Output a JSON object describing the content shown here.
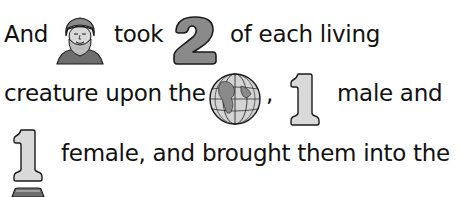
{
  "rebus": {
    "line1": {
      "w1": "And",
      "icon_noah": "noah-portrait",
      "w2": "took",
      "num": "2",
      "w3": "of each living"
    },
    "line2": {
      "w1": "creature upon the",
      "icon_globe": "globe",
      "comma": ",",
      "num": "1",
      "w2": "male and"
    },
    "line3": {
      "num": "1",
      "w1": "female, and brought them into the"
    },
    "line4": {
      "icon_partial": "ark"
    },
    "colors": {
      "number_fill_dark": "#8a8a8a",
      "number_fill_light": "#d9d9d9",
      "outline": "#1a1a1a"
    }
  }
}
